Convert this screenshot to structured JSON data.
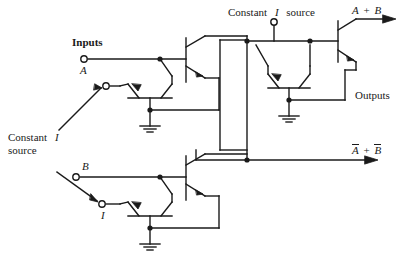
{
  "figure": {
    "type": "circuit-schematic",
    "background": "#ffffff",
    "line_color": "#1a1a1a"
  },
  "labels": {
    "inputs_heading": "Inputs",
    "input_a": "A",
    "input_b": "B",
    "current_symbol": "I",
    "constant_source_left_line1": "Constant",
    "constant_source_left_line2": "source",
    "constant_source_top_word1": "Constant",
    "constant_source_top_word2": "source",
    "outputs_heading": "Outputs",
    "output_or_a": "A",
    "output_or_plus": "+",
    "output_or_b": "B",
    "output_nor_a": "A",
    "output_nor_plus": "+",
    "output_nor_b": "B"
  },
  "nodes": {
    "input_a_terminal": "open-circle-terminal",
    "input_b_terminal": "open-circle-terminal",
    "current_source_top_terminal": "open-circle-terminal",
    "switch_upper_terminal": "open-circle-terminal",
    "switch_lower_terminal": "open-circle-terminal",
    "ground_upper": "ground-symbol",
    "ground_lower": "ground-symbol",
    "ground_center": "ground-symbol"
  },
  "components": {
    "transistor_count": 6,
    "ground_count": 3,
    "junction_dot_count": 8,
    "arrow_outputs": 2
  }
}
